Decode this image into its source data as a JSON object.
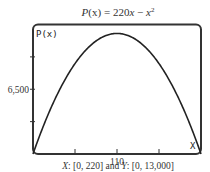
{
  "chart_data": {
    "type": "line",
    "title_parts": {
      "lhs": "P",
      "arg": "(x)",
      "eq": " = 220",
      "var": "x",
      "minus": " − ",
      "sq_var": "x",
      "exp": "2"
    },
    "function": {
      "a": -1,
      "b": 220,
      "c": 0
    },
    "xlim": [
      0,
      220
    ],
    "ylim": [
      0,
      13000
    ],
    "xticks": [
      55,
      110,
      165
    ],
    "yticks": [
      3250,
      6500,
      9750
    ],
    "xtick_labels": [
      {
        "value": 110,
        "label": "110"
      }
    ],
    "ytick_labels": [
      {
        "value": 6500,
        "label": "6,500"
      }
    ],
    "screen_ylabel": "P(x)",
    "screen_xlabel": "X",
    "caption": {
      "x_var": "X",
      "x_range": ": [0, 220] and ",
      "y_var": "Y",
      "y_range": ": [0, 13,000]"
    },
    "grid": false,
    "colors": {
      "curve": "#222222",
      "frame": "#333333"
    }
  }
}
